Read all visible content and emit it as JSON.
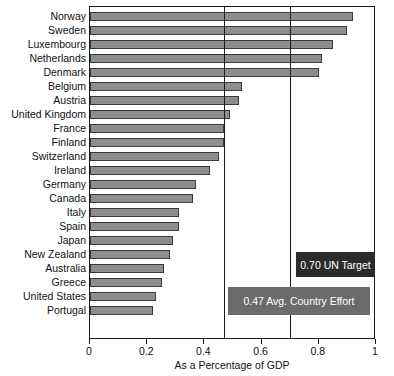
{
  "chart_data": {
    "type": "bar",
    "orientation": "horizontal",
    "title": "",
    "xlabel": "As a Percentage of GDP",
    "ylabel": "",
    "xlim": [
      0,
      1
    ],
    "xticks": [
      "0",
      "0.2",
      "0.4",
      "0.6",
      "0.8",
      "1"
    ],
    "xtick_values": [
      0,
      0.2,
      0.4,
      0.6,
      0.8,
      1
    ],
    "grid": false,
    "legend": "none",
    "categories": [
      "Norway",
      "Sweden",
      "Luxembourg",
      "Netherlands",
      "Denmark",
      "Belgium",
      "Austria",
      "United Kingdom",
      "France",
      "Finland",
      "Switzerland",
      "Ireland",
      "Germany",
      "Canada",
      "Italy",
      "Spain",
      "Japan",
      "New Zealand",
      "Australia",
      "Greece",
      "United States",
      "Portugal"
    ],
    "values": [
      0.92,
      0.9,
      0.85,
      0.81,
      0.8,
      0.53,
      0.52,
      0.49,
      0.47,
      0.47,
      0.45,
      0.42,
      0.37,
      0.36,
      0.31,
      0.31,
      0.29,
      0.28,
      0.26,
      0.25,
      0.23,
      0.22
    ],
    "bar_color": "#8d8d8d",
    "bar_edge_color": "#3a3a3a",
    "reference_lines": [
      {
        "name": "avg-country-effort",
        "value": 0.47
      },
      {
        "name": "un-target",
        "value": 0.7
      }
    ],
    "annotations": [
      {
        "name": "un-target",
        "label": "0.70 UN Target",
        "value": 0.7,
        "box_color": "#2b2b2b",
        "text_color": "#ffffff"
      },
      {
        "name": "avg-country-effort",
        "label": "0.47 Avg. Country Effort",
        "value": 0.47,
        "box_color": "#6b6b6b",
        "text_color": "#ffffff"
      }
    ]
  }
}
